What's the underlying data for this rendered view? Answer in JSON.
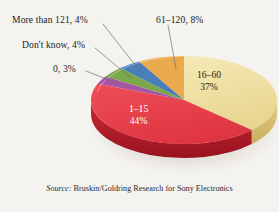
{
  "chart_data": {
    "type": "pie",
    "title": "",
    "subtitle": "",
    "xlabel": "",
    "ylabel": "",
    "legend_position": "callout-labels",
    "grid": false,
    "three_d": true,
    "value_unit": "percent",
    "total": 100,
    "categories": [
      "16–60",
      "1–15",
      "0",
      "Don't know",
      "More than 121",
      "61–120"
    ],
    "values": [
      37,
      44,
      3,
      4,
      4,
      8
    ],
    "labels": [
      "16–60 37%",
      "1–15 44%",
      "0, 3%",
      "Don't know, 4%",
      "More than 121, 4%",
      "61–120, 8%"
    ],
    "colors": [
      "#efdd9b",
      "#e8404a",
      "#a855a8",
      "#7ba84a",
      "#4a7ebb",
      "#e9a94c"
    ],
    "slices": [
      {
        "name": "16–60",
        "value": 37,
        "value_text": "37%",
        "label": "16–60",
        "color": "#efdd9b",
        "side_color": "#d9c276",
        "label_placement": "inside"
      },
      {
        "name": "1–15",
        "value": 44,
        "value_text": "44%",
        "label": "1–15",
        "color": "#e8404a",
        "side_color": "#b22230",
        "label_placement": "inside"
      },
      {
        "name": "0",
        "value": 3,
        "value_text": "3%",
        "label": "0",
        "color": "#a855a8",
        "side_color": "#7e3f80",
        "label_placement": "callout"
      },
      {
        "name": "Don't know",
        "value": 4,
        "value_text": "4%",
        "label": "Don't know",
        "color": "#7ba84a",
        "side_color": "#5c8036",
        "label_placement": "callout"
      },
      {
        "name": "More than 121",
        "value": 4,
        "value_text": "4%",
        "label": "More than 121",
        "color": "#4a7ebb",
        "side_color": "#355d8c",
        "label_placement": "callout"
      },
      {
        "name": "61–120",
        "value": 8,
        "value_text": "8%",
        "label": "61–120",
        "color": "#e9a94c",
        "side_color": "#bd8430",
        "label_placement": "callout"
      }
    ],
    "callouts": [
      {
        "id": "more-than-121",
        "text": "More than 121, 4%"
      },
      {
        "id": "61-120",
        "text": "61–120, 8%"
      },
      {
        "id": "dont-know",
        "text": "Don't know, 4%"
      },
      {
        "id": "zero",
        "text": "0, 3%"
      }
    ],
    "inside_labels": [
      {
        "id": "16-60",
        "line1": "16–60",
        "line2": "37%"
      },
      {
        "id": "1-15",
        "line1": "1–15",
        "line2": "44%"
      }
    ],
    "source": {
      "prefix": "Source:",
      "text": "Bruskin/Goldring Research for Sony Electronics"
    },
    "background_color": "#f5f3ef",
    "leader_line_color": "#6b6b6b"
  }
}
